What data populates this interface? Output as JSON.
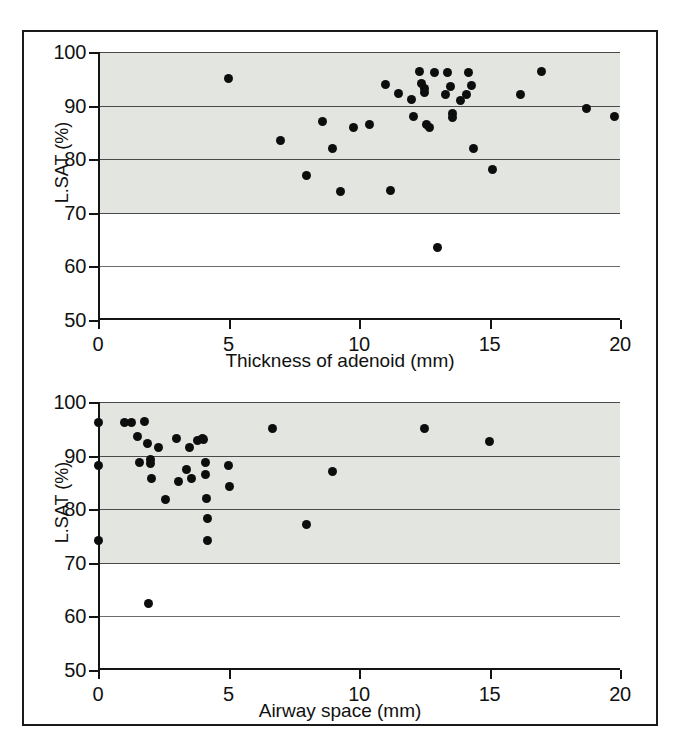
{
  "figure": {
    "caption": "",
    "background_color": "#ffffff",
    "frame_color": "#1a1a1a",
    "band_color": "#e3e5e0",
    "point_color": "#0d0d0d"
  },
  "chart_data": [
    {
      "type": "scatter",
      "panel": "top",
      "title": "",
      "xlabel": "Thickness of adenoid (mm)",
      "ylabel": "L.SAT (%)",
      "xlim": [
        0,
        20
      ],
      "ylim": [
        50,
        100
      ],
      "xticks": [
        0,
        5,
        10,
        15,
        20
      ],
      "yticks": [
        50,
        60,
        70,
        80,
        90,
        100
      ],
      "xtick_labels": [
        "0",
        "5",
        "10",
        "15",
        "20"
      ],
      "ytick_labels": [
        "50",
        "60",
        "70",
        "80",
        "90",
        "100"
      ],
      "grid": true,
      "shaded_band": [
        70,
        100
      ],
      "legend": "none",
      "points": [
        {
          "x": 5.0,
          "y": 95.0
        },
        {
          "x": 7.0,
          "y": 83.5
        },
        {
          "x": 8.0,
          "y": 77.0
        },
        {
          "x": 8.6,
          "y": 87.0
        },
        {
          "x": 9.0,
          "y": 82.0
        },
        {
          "x": 9.3,
          "y": 74.0
        },
        {
          "x": 9.8,
          "y": 86.0
        },
        {
          "x": 10.4,
          "y": 86.5
        },
        {
          "x": 11.0,
          "y": 94.0
        },
        {
          "x": 11.2,
          "y": 74.2
        },
        {
          "x": 11.5,
          "y": 92.2
        },
        {
          "x": 12.0,
          "y": 91.2
        },
        {
          "x": 12.1,
          "y": 88.0
        },
        {
          "x": 12.3,
          "y": 96.3
        },
        {
          "x": 12.4,
          "y": 94.2
        },
        {
          "x": 12.5,
          "y": 93.2
        },
        {
          "x": 12.5,
          "y": 92.5
        },
        {
          "x": 12.6,
          "y": 86.5
        },
        {
          "x": 12.7,
          "y": 86.0
        },
        {
          "x": 12.9,
          "y": 96.2
        },
        {
          "x": 13.0,
          "y": 63.5
        },
        {
          "x": 13.3,
          "y": 92.0
        },
        {
          "x": 13.4,
          "y": 96.2
        },
        {
          "x": 13.5,
          "y": 93.5
        },
        {
          "x": 13.6,
          "y": 88.6
        },
        {
          "x": 13.6,
          "y": 87.8
        },
        {
          "x": 13.9,
          "y": 91.0
        },
        {
          "x": 14.1,
          "y": 92.0
        },
        {
          "x": 14.2,
          "y": 96.2
        },
        {
          "x": 14.3,
          "y": 93.8
        },
        {
          "x": 14.4,
          "y": 82.0
        },
        {
          "x": 15.1,
          "y": 78.0
        },
        {
          "x": 16.2,
          "y": 92.0
        },
        {
          "x": 17.0,
          "y": 96.3
        },
        {
          "x": 18.7,
          "y": 89.4
        },
        {
          "x": 19.8,
          "y": 88.0
        }
      ]
    },
    {
      "type": "scatter",
      "panel": "bottom",
      "title": "",
      "xlabel": "Airway space (mm)",
      "ylabel": "L.SAT (%)",
      "xlim": [
        0,
        20
      ],
      "ylim": [
        50,
        100
      ],
      "xticks": [
        0,
        5,
        10,
        15,
        20
      ],
      "yticks": [
        50,
        60,
        70,
        80,
        90,
        100
      ],
      "xtick_labels": [
        "0",
        "5",
        "10",
        "15",
        "20"
      ],
      "ytick_labels": [
        "50",
        "60",
        "70",
        "80",
        "90",
        "100"
      ],
      "grid": true,
      "shaded_band": [
        70,
        100
      ],
      "legend": "none",
      "points": [
        {
          "x": 0.0,
          "y": 96.2
        },
        {
          "x": 0.0,
          "y": 88.2
        },
        {
          "x": 0.0,
          "y": 74.2
        },
        {
          "x": 1.0,
          "y": 96.2
        },
        {
          "x": 1.3,
          "y": 96.2
        },
        {
          "x": 1.5,
          "y": 93.6
        },
        {
          "x": 1.6,
          "y": 88.8
        },
        {
          "x": 1.8,
          "y": 96.3
        },
        {
          "x": 1.9,
          "y": 92.2
        },
        {
          "x": 1.95,
          "y": 62.5
        },
        {
          "x": 2.0,
          "y": 89.3
        },
        {
          "x": 2.0,
          "y": 88.5
        },
        {
          "x": 2.05,
          "y": 85.8
        },
        {
          "x": 2.3,
          "y": 91.5
        },
        {
          "x": 2.6,
          "y": 81.8
        },
        {
          "x": 3.0,
          "y": 93.2
        },
        {
          "x": 3.1,
          "y": 85.2
        },
        {
          "x": 3.4,
          "y": 87.5
        },
        {
          "x": 3.5,
          "y": 91.6
        },
        {
          "x": 3.6,
          "y": 85.8
        },
        {
          "x": 3.8,
          "y": 92.8
        },
        {
          "x": 4.0,
          "y": 93.2
        },
        {
          "x": 4.05,
          "y": 93.0
        },
        {
          "x": 4.1,
          "y": 88.8
        },
        {
          "x": 4.1,
          "y": 86.4
        },
        {
          "x": 4.15,
          "y": 82.0
        },
        {
          "x": 4.2,
          "y": 78.2
        },
        {
          "x": 4.2,
          "y": 74.2
        },
        {
          "x": 5.0,
          "y": 88.2
        },
        {
          "x": 5.05,
          "y": 84.2
        },
        {
          "x": 6.7,
          "y": 95.0
        },
        {
          "x": 8.0,
          "y": 77.2
        },
        {
          "x": 9.0,
          "y": 87.0
        },
        {
          "x": 12.5,
          "y": 95.0
        },
        {
          "x": 15.0,
          "y": 92.6
        }
      ]
    }
  ]
}
